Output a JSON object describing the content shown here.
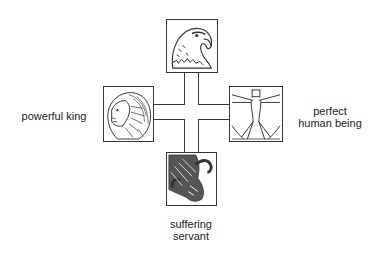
{
  "diagram": {
    "type": "cross",
    "center": "cross-connector",
    "nodes": [
      {
        "id": "top",
        "figure": "eagle",
        "icon": "eagle-head-icon",
        "label": ""
      },
      {
        "id": "left",
        "figure": "lion",
        "icon": "lion-head-icon",
        "label": "powerful king"
      },
      {
        "id": "right",
        "figure": "man",
        "icon": "vitruvian-man-icon",
        "label_line1": "perfect",
        "label_line2": "human being"
      },
      {
        "id": "bottom",
        "figure": "ox",
        "icon": "ox-head-icon",
        "label_line1": "suffering",
        "label_line2": "servant"
      }
    ],
    "colors": {
      "line": "#333333",
      "background": "#ffffff",
      "text": "#222222"
    }
  }
}
